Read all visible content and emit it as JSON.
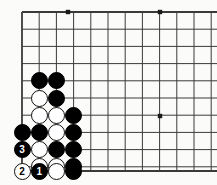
{
  "figure": {
    "name": "go-board-diagram",
    "width": 217,
    "height": 185,
    "background_color": "#fbfbf9",
    "line_color": "#3a3a3a",
    "black_color": "#000000",
    "white_color": "#ffffff"
  },
  "board": {
    "origin_x": 22,
    "origin_y": 12,
    "spacing": 17.2,
    "columns": 12,
    "rows": 10,
    "bottom_edge_y": 171,
    "left_edge_col": 0,
    "edge_line_width": 1.8,
    "grid_line_width": 1,
    "star_points": [
      {
        "col": 2.7,
        "row": 0,
        "x": 68,
        "y": 12
      },
      {
        "col": 8,
        "row": 0,
        "x": 160,
        "y": 12
      },
      {
        "col": 8,
        "row": 6,
        "x": 160,
        "y": 116
      }
    ]
  },
  "stones": [
    {
      "name": "stone-b-c1r4",
      "color": "black",
      "col": 1,
      "row": 4,
      "label": ""
    },
    {
      "name": "stone-b-c2r4",
      "color": "black",
      "col": 2,
      "row": 4,
      "label": ""
    },
    {
      "name": "stone-w-c1r5",
      "color": "white",
      "col": 1,
      "row": 5,
      "label": ""
    },
    {
      "name": "stone-b-c2r5",
      "color": "black",
      "col": 2,
      "row": 5,
      "label": ""
    },
    {
      "name": "stone-w-c1r6",
      "color": "white",
      "col": 1,
      "row": 6,
      "label": ""
    },
    {
      "name": "stone-w-c2r6",
      "color": "white",
      "col": 2,
      "row": 6,
      "label": ""
    },
    {
      "name": "stone-b-c3r6",
      "color": "black",
      "col": 3,
      "row": 6,
      "label": ""
    },
    {
      "name": "stone-b-c0r7",
      "color": "black",
      "col": 0,
      "row": 7,
      "label": ""
    },
    {
      "name": "stone-b-c1r7",
      "color": "black",
      "col": 1,
      "row": 7,
      "label": ""
    },
    {
      "name": "stone-w-c2r7",
      "color": "white",
      "col": 2,
      "row": 7,
      "label": ""
    },
    {
      "name": "stone-b-c3r7",
      "color": "black",
      "col": 3,
      "row": 7,
      "label": ""
    },
    {
      "name": "stone-b-move-3",
      "color": "black",
      "col": 0,
      "row": 8,
      "label": "3"
    },
    {
      "name": "stone-w-c1r8",
      "color": "white",
      "col": 1,
      "row": 8,
      "label": ""
    },
    {
      "name": "stone-b-c2r8",
      "color": "black",
      "col": 2,
      "row": 8,
      "label": ""
    },
    {
      "name": "stone-b-c3r8",
      "color": "black",
      "col": 3,
      "row": 8,
      "label": ""
    },
    {
      "name": "stone-w-c1r9",
      "color": "white",
      "col": 1,
      "row": 9,
      "label": ""
    },
    {
      "name": "stone-w-c2r9",
      "color": "white",
      "col": 2,
      "row": 9,
      "label": ""
    },
    {
      "name": "stone-b-c3r9",
      "color": "black",
      "col": 3,
      "row": 9,
      "label": ""
    },
    {
      "name": "stone-w-move-2",
      "color": "white",
      "col": 0,
      "row": 10,
      "label": "2"
    },
    {
      "name": "stone-b-move-1",
      "color": "black",
      "col": 1,
      "row": 10,
      "label": "1"
    },
    {
      "name": "stone-w-c2r10",
      "color": "white",
      "col": 2,
      "row": 10,
      "label": ""
    },
    {
      "name": "stone-b-c3r10",
      "color": "black",
      "col": 3,
      "row": 10,
      "label": ""
    }
  ],
  "moves": [
    {
      "number": "1",
      "color": "black"
    },
    {
      "number": "2",
      "color": "white"
    },
    {
      "number": "3",
      "color": "black"
    }
  ]
}
